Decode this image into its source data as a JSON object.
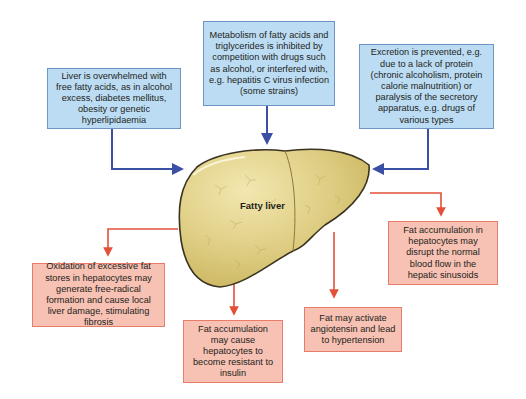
{
  "diagram": {
    "center_label": "Fatty liver",
    "colors": {
      "cause_fill": "#bcdcf4",
      "cause_border": "#6f95c6",
      "cause_arrow": "#3b4fa5",
      "effect_fill": "#f7c1b3",
      "effect_border": "#e87c6a",
      "effect_arrow": "#e2503a",
      "liver_fill": "#d9c77a",
      "liver_outline": "#3a3320"
    },
    "causes": [
      {
        "id": "free-fatty-acids",
        "text": "Liver is overwhelmed with free fatty acids, as in alcohol excess, diabetes mellitus, obesity or genetic hyperlipidaemia"
      },
      {
        "id": "metabolism-inhibited",
        "text": "Metabolism of fatty acids and triglycerides is inhibited by competition with drugs such as alcohol, or interfered with, e.g. hepatitis C virus infection (some strains)"
      },
      {
        "id": "excretion-prevented",
        "text": "Excretion is prevented, e.g. due to a lack of protein (chronic alcoholism, protein calorie malnutrition) or paralysis of the secretory apparatus, e.g. drugs of various types"
      }
    ],
    "effects": [
      {
        "id": "oxidation",
        "text": "Oxidation of excessive fat stores in hepatocytes may generate free-radical formation and cause local liver damage, stimulating fibrosis"
      },
      {
        "id": "insulin-resistance",
        "text": "Fat accumulation may cause hepatocytes to become resistant to insulin"
      },
      {
        "id": "hypertension",
        "text": "Fat may activate angiotensin and lead to hypertension"
      },
      {
        "id": "blood-flow",
        "text": "Fat accumulation in hepatocytes may disrupt the normal blood flow in the hepatic sinusoids"
      }
    ]
  }
}
